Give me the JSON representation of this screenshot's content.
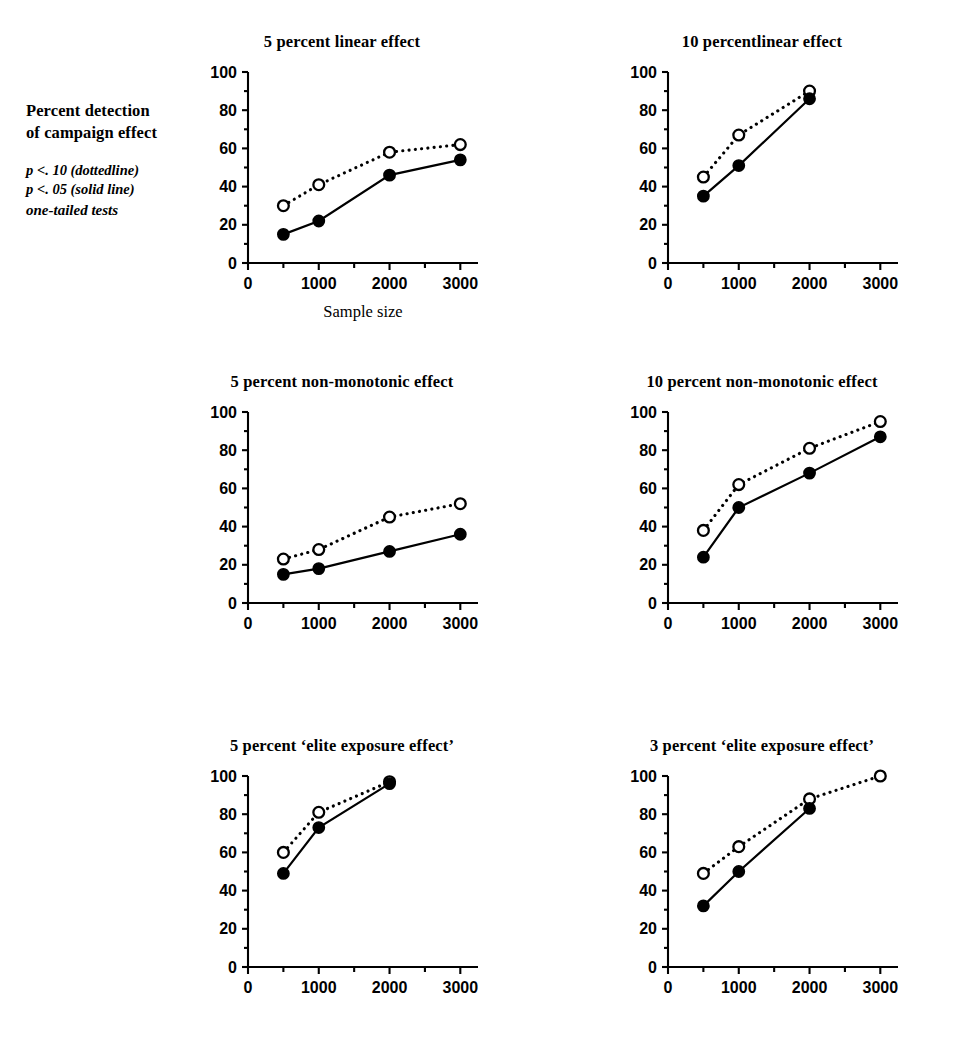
{
  "figure": {
    "legend": {
      "heading_line1": "Percent detection",
      "heading_line2": "of campaign effect",
      "note_line1": "p <. 10  (dottedline)",
      "note_line2": "p <. 05  (solid line)",
      "note_line3": "one-tailed tests"
    },
    "shared": {
      "x_axis_title": "Sample size",
      "y_ticks": [
        0,
        20,
        40,
        60,
        80,
        100
      ],
      "x_ticks": [
        0,
        1000,
        2000,
        3000
      ],
      "y_tick_labels": [
        "0",
        "20",
        "40",
        "60",
        "80",
        "100"
      ],
      "x_tick_labels": [
        "0",
        "1000",
        "2000",
        "3000"
      ],
      "ylim": [
        0,
        100
      ],
      "xlim": [
        0,
        3250
      ],
      "series_names": [
        "p < .10 (dotted line)",
        "p < .05 (solid line)"
      ]
    }
  },
  "chart_data": [
    {
      "id": "five-percent-linear-effect",
      "type": "line",
      "title": "5 percent linear effect",
      "xlabel": "Sample size",
      "ylabel": "Percent detection of campaign effect",
      "xlim": [
        0,
        3250
      ],
      "ylim": [
        0,
        100
      ],
      "xticks": [
        0,
        1000,
        2000,
        3000
      ],
      "yticks": [
        0,
        20,
        40,
        60,
        80,
        100
      ],
      "grid": false,
      "legend_position": "outside-left",
      "x": [
        500,
        1000,
        2000,
        3000
      ],
      "series": [
        {
          "name": "p < .10 (dotted line)",
          "style": "dotted",
          "marker": "open",
          "x": [
            500,
            1000,
            2000,
            3000
          ],
          "values": [
            30,
            41,
            58,
            62
          ]
        },
        {
          "name": "p < .05 (solid line)",
          "style": "solid",
          "marker": "filled",
          "x": [
            500,
            1000,
            2000,
            3000
          ],
          "values": [
            15,
            22,
            46,
            54
          ]
        }
      ]
    },
    {
      "id": "ten-percent-linear-effect",
      "type": "line",
      "title": "10 percentlinear effect",
      "xlabel": "",
      "ylabel": "",
      "xlim": [
        0,
        3250
      ],
      "ylim": [
        0,
        100
      ],
      "xticks": [
        0,
        1000,
        2000,
        3000
      ],
      "yticks": [
        0,
        20,
        40,
        60,
        80,
        100
      ],
      "grid": false,
      "x": [
        500,
        1000,
        2000
      ],
      "series": [
        {
          "name": "p < .10 (dotted line)",
          "style": "dotted",
          "marker": "open",
          "x": [
            500,
            1000,
            2000
          ],
          "values": [
            45,
            67,
            90
          ]
        },
        {
          "name": "p < .05 (solid line)",
          "style": "solid",
          "marker": "filled",
          "x": [
            500,
            1000,
            2000
          ],
          "values": [
            35,
            51,
            86
          ]
        }
      ]
    },
    {
      "id": "five-percent-non-monotonic-effect",
      "type": "line",
      "title": "5 percent non-monotonic effect",
      "xlabel": "",
      "ylabel": "",
      "xlim": [
        0,
        3250
      ],
      "ylim": [
        0,
        100
      ],
      "xticks": [
        0,
        1000,
        2000,
        3000
      ],
      "yticks": [
        0,
        20,
        40,
        60,
        80,
        100
      ],
      "grid": false,
      "x": [
        500,
        1000,
        2000,
        3000
      ],
      "series": [
        {
          "name": "p < .10 (dotted line)",
          "style": "dotted",
          "marker": "open",
          "x": [
            500,
            1000,
            2000,
            3000
          ],
          "values": [
            23,
            28,
            45,
            52
          ]
        },
        {
          "name": "p < .05 (solid line)",
          "style": "solid",
          "marker": "filled",
          "x": [
            500,
            1000,
            2000,
            3000
          ],
          "values": [
            15,
            18,
            27,
            36
          ]
        }
      ]
    },
    {
      "id": "ten-percent-non-monotonic-effect",
      "type": "line",
      "title": "10 percent non-monotonic effect",
      "xlabel": "",
      "ylabel": "",
      "xlim": [
        0,
        3250
      ],
      "ylim": [
        0,
        100
      ],
      "xticks": [
        0,
        1000,
        2000,
        3000
      ],
      "yticks": [
        0,
        20,
        40,
        60,
        80,
        100
      ],
      "grid": false,
      "x": [
        500,
        1000,
        2000,
        3000
      ],
      "series": [
        {
          "name": "p < .10 (dotted line)",
          "style": "dotted",
          "marker": "open",
          "x": [
            500,
            1000,
            2000,
            3000
          ],
          "values": [
            38,
            62,
            81,
            95
          ]
        },
        {
          "name": "p < .05 (solid line)",
          "style": "solid",
          "marker": "filled",
          "x": [
            500,
            1000,
            2000,
            3000
          ],
          "values": [
            24,
            50,
            68,
            87
          ]
        }
      ]
    },
    {
      "id": "five-percent-elite-exposure-effect",
      "type": "line",
      "title": "5 percent ‘elite exposure effect’",
      "xlabel": "",
      "ylabel": "",
      "xlim": [
        0,
        3250
      ],
      "ylim": [
        0,
        100
      ],
      "xticks": [
        0,
        1000,
        2000,
        3000
      ],
      "yticks": [
        0,
        20,
        40,
        60,
        80,
        100
      ],
      "grid": false,
      "x": [
        500,
        1000,
        2000
      ],
      "series": [
        {
          "name": "p < .10 (dotted line)",
          "style": "dotted",
          "marker": "open",
          "x": [
            500,
            1000,
            2000
          ],
          "values": [
            60,
            81,
            97
          ]
        },
        {
          "name": "p < .05 (solid line)",
          "style": "solid",
          "marker": "filled",
          "x": [
            500,
            1000,
            2000
          ],
          "values": [
            49,
            73,
            96
          ]
        }
      ]
    },
    {
      "id": "three-percent-elite-exposure-effect",
      "type": "line",
      "title": "3 percent ‘elite exposure effect’",
      "xlabel": "",
      "ylabel": "",
      "xlim": [
        0,
        3250
      ],
      "ylim": [
        0,
        100
      ],
      "xticks": [
        0,
        1000,
        2000,
        3000
      ],
      "yticks": [
        0,
        20,
        40,
        60,
        80,
        100
      ],
      "grid": false,
      "x": [
        500,
        1000,
        2000,
        3000
      ],
      "series": [
        {
          "name": "p < .10 (dotted line)",
          "style": "dotted",
          "marker": "open",
          "x": [
            500,
            1000,
            2000,
            3000
          ],
          "values": [
            49,
            63,
            88,
            100
          ]
        },
        {
          "name": "p < .05 (solid line)",
          "style": "solid",
          "marker": "filled",
          "x": [
            500,
            1000,
            2000
          ],
          "values": [
            32,
            50,
            83
          ]
        }
      ]
    }
  ],
  "layout": {
    "panels": [
      {
        "chart": 0,
        "left": 196,
        "top": 32,
        "width": 292,
        "show_x_axis_title": true
      },
      {
        "chart": 1,
        "left": 616,
        "top": 32,
        "width": 292,
        "show_x_axis_title": false
      },
      {
        "chart": 2,
        "left": 196,
        "top": 372,
        "width": 292,
        "show_x_axis_title": false
      },
      {
        "chart": 3,
        "left": 616,
        "top": 372,
        "width": 292,
        "show_x_axis_title": false
      },
      {
        "chart": 4,
        "left": 196,
        "top": 736,
        "width": 292,
        "show_x_axis_title": false
      },
      {
        "chart": 5,
        "left": 616,
        "top": 736,
        "width": 292,
        "show_x_axis_title": false
      }
    ]
  }
}
